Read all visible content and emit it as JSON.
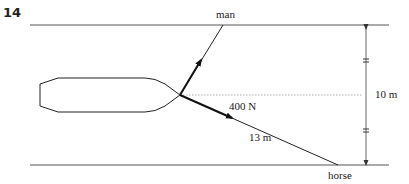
{
  "question_number": "14",
  "labels": {
    "man": "man",
    "horse": "horse",
    "force": "400 N",
    "rope_length": "13 m",
    "width": "10 m"
  },
  "colors": {
    "line": "#222222",
    "bank": "#555555",
    "dotted": "#999999"
  }
}
